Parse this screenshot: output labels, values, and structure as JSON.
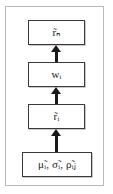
{
  "diagram": {
    "type": "flowchart",
    "orientation": "bottom-to-top",
    "frame": {
      "border_color": "#b9b9b9",
      "background": "#ffffff"
    },
    "node_style": {
      "border_color": "#3a3a3a",
      "fill": "#ffffff",
      "text_color": "#1a1a1a"
    },
    "arrow_color": "#1a1a1a",
    "nodes": [
      {
        "id": "rn",
        "label": "r̃ₙ",
        "order": 4,
        "role": "output"
      },
      {
        "id": "wi",
        "label": "wᵢ",
        "order": 3,
        "role": "weights"
      },
      {
        "id": "ri",
        "label": "r̃ᵢ",
        "order": 2,
        "role": "intermediate"
      },
      {
        "id": "inputs",
        "label": "μ̃ᵢ, σ̃ᵢ, ρ̃ᵢⱼ",
        "order": 1,
        "role": "input"
      }
    ],
    "edges": [
      {
        "id": "in-to-ri",
        "from": "inputs",
        "to": "ri",
        "glyph": "arrow-up-icon"
      },
      {
        "id": "ri-to-wi",
        "from": "ri",
        "to": "wi",
        "glyph": "arrow-up-icon"
      },
      {
        "id": "wi-to-rn",
        "from": "wi",
        "to": "rn",
        "glyph": "arrow-up-icon"
      }
    ]
  }
}
